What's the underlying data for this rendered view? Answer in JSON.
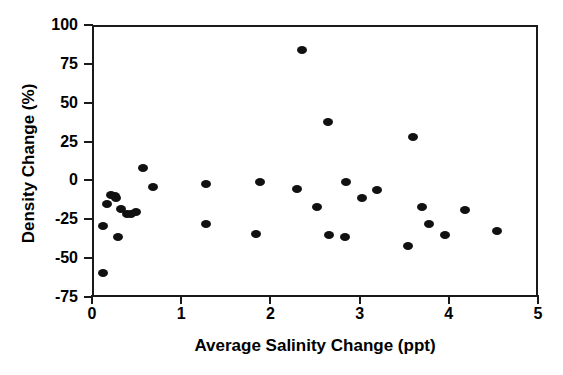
{
  "chart_data": {
    "type": "scatter",
    "title": "",
    "xlabel": "Average Salinity Change (ppt)",
    "ylabel": "Density Change (%)",
    "xlim": [
      0,
      5
    ],
    "ylim": [
      -75,
      100
    ],
    "xticks": [
      0,
      1,
      2,
      3,
      4,
      5
    ],
    "xtick_labels": [
      "0",
      "1",
      "2",
      "3",
      "4",
      "5"
    ],
    "yticks": [
      -75,
      -50,
      -25,
      0,
      25,
      50,
      75,
      100
    ],
    "ytick_labels": [
      "-75",
      "-50",
      "-25",
      "0",
      "25",
      "50",
      "75",
      "100"
    ],
    "grid": false,
    "legend": null,
    "marker": {
      "shape": "circle",
      "color": "#111111",
      "size": 9
    },
    "series": [
      {
        "name": "Observations",
        "points": [
          {
            "x": 0.1,
            "y": -58
          },
          {
            "x": 0.1,
            "y": -28
          },
          {
            "x": 0.15,
            "y": -14
          },
          {
            "x": 0.19,
            "y": -8
          },
          {
            "x": 0.25,
            "y": -10
          },
          {
            "x": 0.24,
            "y": -9
          },
          {
            "x": 0.27,
            "y": -35
          },
          {
            "x": 0.3,
            "y": -17
          },
          {
            "x": 0.37,
            "y": -20
          },
          {
            "x": 0.42,
            "y": -20
          },
          {
            "x": 0.47,
            "y": -19
          },
          {
            "x": 0.55,
            "y": 9
          },
          {
            "x": 0.66,
            "y": -3
          },
          {
            "x": 1.25,
            "y": -1
          },
          {
            "x": 1.26,
            "y": -27
          },
          {
            "x": 1.82,
            "y": -33
          },
          {
            "x": 1.86,
            "y": 0
          },
          {
            "x": 2.28,
            "y": -4
          },
          {
            "x": 2.33,
            "y": 85
          },
          {
            "x": 2.5,
            "y": -16
          },
          {
            "x": 2.62,
            "y": 39
          },
          {
            "x": 2.63,
            "y": -34
          },
          {
            "x": 2.81,
            "y": -35
          },
          {
            "x": 2.83,
            "y": 0
          },
          {
            "x": 3.01,
            "y": -10
          },
          {
            "x": 3.17,
            "y": -5
          },
          {
            "x": 3.52,
            "y": -41
          },
          {
            "x": 3.58,
            "y": 29
          },
          {
            "x": 3.68,
            "y": -16
          },
          {
            "x": 3.76,
            "y": -27
          },
          {
            "x": 3.93,
            "y": -34
          },
          {
            "x": 4.16,
            "y": -18
          },
          {
            "x": 4.52,
            "y": -31
          }
        ]
      }
    ]
  }
}
